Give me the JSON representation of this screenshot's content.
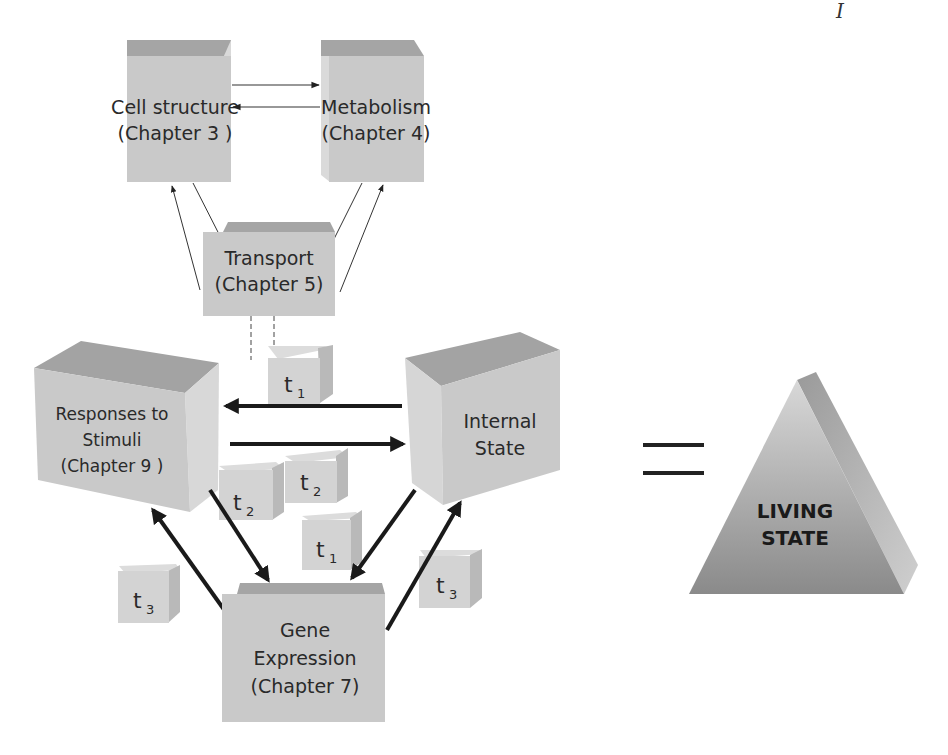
{
  "page": {
    "corner_mark": "I"
  },
  "boxes": {
    "cell_structure": {
      "line1": "Cell structure",
      "line2": "(Chapter 3 )"
    },
    "metabolism": {
      "line1": "Metabolism",
      "line2": "(Chapter 4)"
    },
    "transport": {
      "line1": "Transport",
      "line2": "(Chapter 5)"
    },
    "responses": {
      "line1": "Responses to",
      "line2": "Stimuli",
      "line3": "(Chapter 9 )"
    },
    "internal_state": {
      "line1": "Internal",
      "line2": "State"
    },
    "gene_expression": {
      "line1": "Gene",
      "line2": "Expression",
      "line3": "(Chapter 7)"
    }
  },
  "time_cubes": [
    {
      "base": "t",
      "sub": "1"
    },
    {
      "base": "t",
      "sub": "2"
    },
    {
      "base": "t",
      "sub": "2"
    },
    {
      "base": "t",
      "sub": "1"
    },
    {
      "base": "t",
      "sub": "3"
    },
    {
      "base": "t",
      "sub": "3"
    }
  ],
  "equals_sign": "=",
  "pyramid": {
    "line1": "LIVING",
    "line2": "STATE"
  },
  "colors": {
    "box_front": "#c9c9c9",
    "box_top": "#a3a3a3",
    "box_side": "#dcdcdc",
    "arrow": "#1a1a1a",
    "pyramid_light": "#cfcfcf",
    "pyramid_dark": "#8e8e8e"
  }
}
